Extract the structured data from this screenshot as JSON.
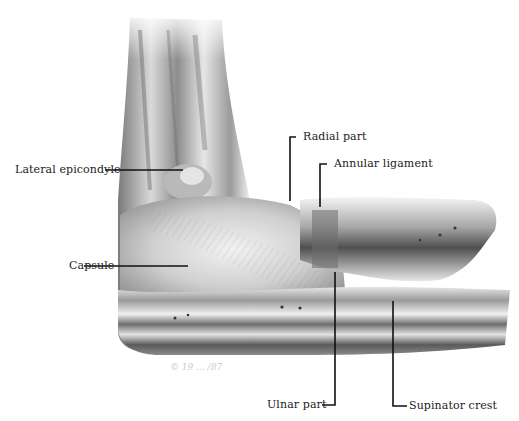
{
  "figure": {
    "labels": [
      {
        "id": "lateral-epicondyle",
        "text": "Lateral epicondyle"
      },
      {
        "id": "capsule",
        "text": "Capsule"
      },
      {
        "id": "radial-part",
        "text": "Radial part"
      },
      {
        "id": "annular-ligament",
        "text": "Annular ligament"
      },
      {
        "id": "ulnar-part",
        "text": "Ulnar part"
      },
      {
        "id": "supinator-crest",
        "text": "Supinator crest"
      }
    ],
    "signature": "© 19 ... /87",
    "colors": {
      "background": "#ffffff",
      "label_text": "#222222",
      "leader_line": "#111111",
      "bone_light": "#f1f1f1",
      "bone_mid": "#bdbdbd",
      "bone_dark": "#5c5c5c"
    }
  }
}
